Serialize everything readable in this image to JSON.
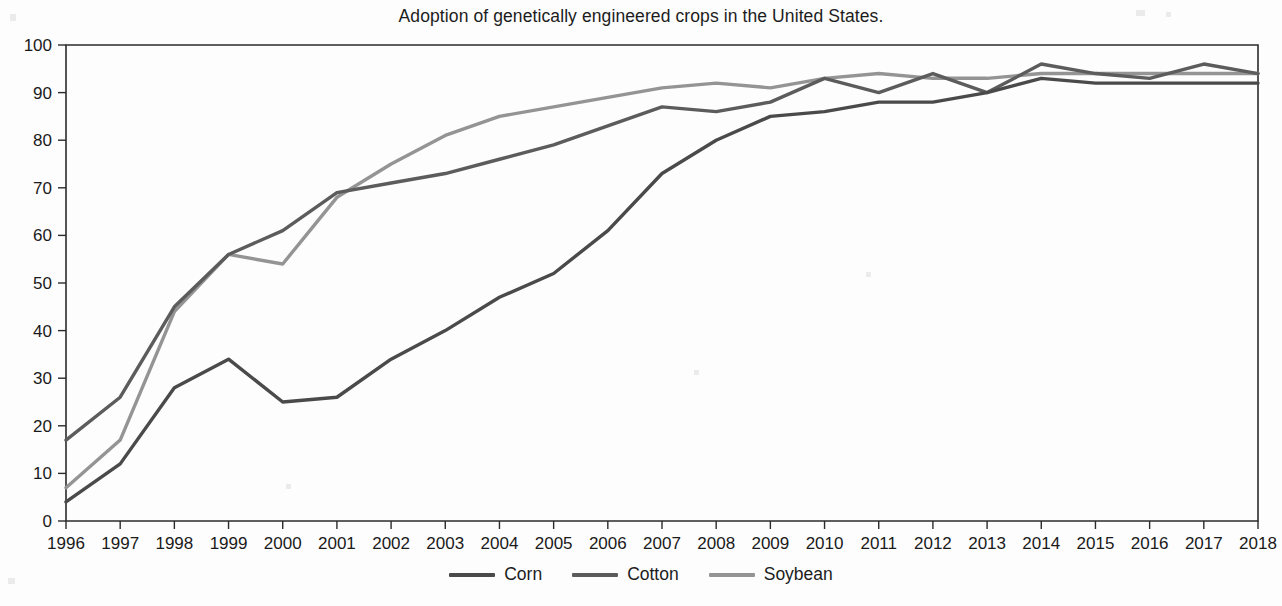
{
  "chart_data": {
    "type": "line",
    "title": "Adoption of genetically engineered crops in the United States.",
    "xlabel": "",
    "ylabel": "",
    "xlim": [
      1996,
      2018
    ],
    "ylim": [
      0,
      100
    ],
    "y_ticks": [
      0,
      10,
      20,
      30,
      40,
      50,
      60,
      70,
      80,
      90,
      100
    ],
    "grid": false,
    "legend_position": "bottom-center",
    "categories": [
      "1996",
      "1997",
      "1998",
      "1999",
      "2000",
      "2001",
      "2002",
      "2003",
      "2004",
      "2005",
      "2006",
      "2007",
      "2008",
      "2009",
      "2010",
      "2011",
      "2012",
      "2013",
      "2014",
      "2015",
      "2016",
      "2017",
      "2018"
    ],
    "series": [
      {
        "name": "Corn",
        "color": "#4a4a4a",
        "values": [
          4,
          12,
          28,
          34,
          25,
          26,
          34,
          40,
          47,
          52,
          61,
          73,
          80,
          85,
          86,
          88,
          88,
          90,
          93,
          92,
          92,
          92,
          92
        ]
      },
      {
        "name": "Cotton",
        "color": "#5c5c5c",
        "values": [
          17,
          26,
          45,
          56,
          61,
          69,
          71,
          73,
          76,
          79,
          83,
          87,
          86,
          88,
          93,
          90,
          94,
          90,
          96,
          94,
          93,
          96,
          94
        ]
      },
      {
        "name": "Soybean",
        "color": "#949494",
        "values": [
          7,
          17,
          44,
          56,
          54,
          68,
          75,
          81,
          85,
          87,
          89,
          91,
          92,
          91,
          93,
          94,
          93,
          93,
          94,
          94,
          94,
          94,
          94
        ]
      }
    ]
  },
  "legend": {
    "items": [
      {
        "label": "Corn",
        "color": "#4a4a4a"
      },
      {
        "label": "Cotton",
        "color": "#5c5c5c"
      },
      {
        "label": "Soybean",
        "color": "#949494"
      }
    ]
  },
  "axes": {
    "x_tick_labels": [
      "1996",
      "1997",
      "1998",
      "1999",
      "2000",
      "2001",
      "2002",
      "2003",
      "2004",
      "2005",
      "2006",
      "2007",
      "2008",
      "2009",
      "2010",
      "2011",
      "2012",
      "2013",
      "2014",
      "2015",
      "2016",
      "2017",
      "2018"
    ],
    "y_tick_labels": [
      "100",
      "90",
      "80",
      "70",
      "60",
      "50",
      "40",
      "30",
      "20",
      "10",
      "0"
    ]
  }
}
